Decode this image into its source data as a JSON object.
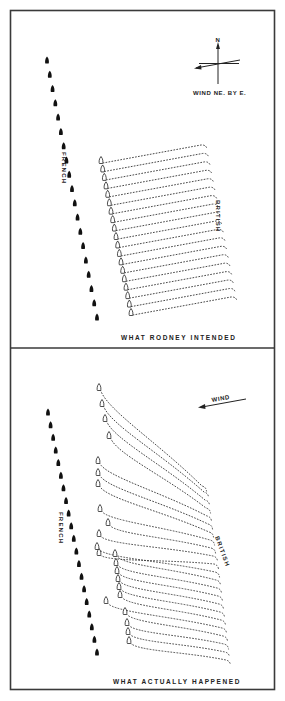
{
  "figure": {
    "colors": {
      "ink": "#222222",
      "frame": "#3a3a3a",
      "background": "#ffffff"
    }
  },
  "panel_top": {
    "caption": "WHAT RODNEY INTENDED",
    "compass": {
      "north_label": "N",
      "wind_label": "WIND  NE. BY E."
    },
    "french_label": "FRENCH",
    "british_label": "BRITISH",
    "french_line": {
      "start": [
        47,
        60
      ],
      "end": [
        97,
        317
      ],
      "count": 19
    },
    "british_line": {
      "start": [
        101,
        160
      ],
      "end": [
        131,
        312
      ],
      "count": 19
    },
    "track_end_offset": [
      103,
      -15
    ]
  },
  "panel_bottom": {
    "caption": "WHAT ACTUALLY HAPPENED",
    "wind_label": "WIND",
    "french_label": "FRENCH",
    "british_label": "BRITISH",
    "french_line": {
      "start": [
        48,
        412
      ],
      "end": [
        97,
        652
      ],
      "count": 20
    },
    "british_ships": [
      {
        "x": 99,
        "y": 387,
        "end": [
          205,
          487
        ]
      },
      {
        "x": 102,
        "y": 403,
        "end": [
          207,
          493
        ]
      },
      {
        "x": 105,
        "y": 418,
        "end": [
          208,
          501
        ]
      },
      {
        "x": 109,
        "y": 435,
        "end": [
          209,
          509
        ]
      },
      {
        "x": 98,
        "y": 460,
        "end": [
          210,
          517
        ]
      },
      {
        "x": 98,
        "y": 472,
        "end": [
          211,
          525
        ]
      },
      {
        "x": 98,
        "y": 483,
        "end": [
          212,
          533
        ]
      },
      {
        "x": 100,
        "y": 508,
        "end": [
          213,
          541
        ]
      },
      {
        "x": 108,
        "y": 522,
        "end": [
          214,
          549
        ]
      },
      {
        "x": 99,
        "y": 533,
        "end": [
          216,
          557
        ]
      },
      {
        "x": 99,
        "y": 552,
        "end": [
          217,
          565
        ]
      },
      {
        "x": 97,
        "y": 546,
        "end": [
          218,
          573
        ]
      },
      {
        "x": 115,
        "y": 553,
        "end": [
          219,
          581
        ]
      },
      {
        "x": 116,
        "y": 562,
        "end": [
          220,
          589
        ]
      },
      {
        "x": 117,
        "y": 570,
        "end": [
          221,
          597
        ]
      },
      {
        "x": 118,
        "y": 578,
        "end": [
          222,
          605
        ]
      },
      {
        "x": 119,
        "y": 586,
        "end": [
          223,
          613
        ]
      },
      {
        "x": 120,
        "y": 594,
        "end": [
          224,
          621
        ]
      },
      {
        "x": 106,
        "y": 600,
        "end": [
          225,
          629
        ]
      },
      {
        "x": 125,
        "y": 611,
        "end": [
          226,
          637
        ]
      },
      {
        "x": 127,
        "y": 622,
        "end": [
          227,
          645
        ]
      },
      {
        "x": 128,
        "y": 631,
        "end": [
          228,
          653
        ]
      },
      {
        "x": 129,
        "y": 640,
        "end": [
          229,
          661
        ]
      }
    ]
  }
}
